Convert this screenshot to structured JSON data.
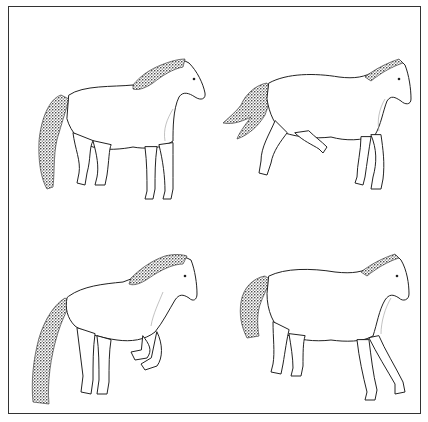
{
  "figure": {
    "border_color": "#333333",
    "ink_color": "#222222",
    "background": "#ffffff",
    "panels": [
      {
        "position": "top-left",
        "pose": "standing, hind legs stepping, head facing right",
        "tail": "long dark stippled tail hanging down"
      },
      {
        "position": "top-right",
        "pose": "trotting, front leg raised, head facing right",
        "tail": "tail flagged out to the left"
      },
      {
        "position": "bottom-left",
        "pose": "rearing/leaping, front legs tucked, head facing right",
        "tail": "long stippled tail hanging down"
      },
      {
        "position": "bottom-right",
        "pose": "walking, legs spread, head facing right",
        "tail": "stippled tail hanging down"
      }
    ]
  }
}
